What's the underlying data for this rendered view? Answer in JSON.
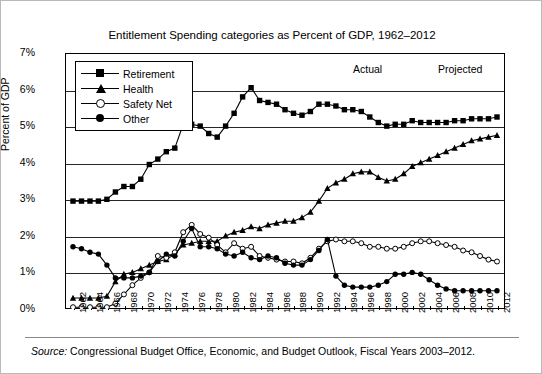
{
  "title": "Entitlement Spending categories as Percent of GDP, 1962–2012",
  "source_prefix": "Source:",
  "source_text": " Congressional Budget Office, Economic, and Budget Outlook, Fiscal Years 2003–2012.",
  "annotations": {
    "actual": "Actual",
    "projected": "Projected"
  },
  "legend": [
    {
      "label": "Retirement",
      "marker": "square-filled"
    },
    {
      "label": "Health",
      "marker": "triangle-filled"
    },
    {
      "label": "Safety Net",
      "marker": "circle-open"
    },
    {
      "label": "Other",
      "marker": "circle-filled"
    }
  ],
  "chart_data": {
    "type": "line",
    "title": "Entitlement Spending categories as Percent of GDP, 1962–2012",
    "xlabel": "",
    "ylabel": "Percent of GDP",
    "ylim": [
      0,
      7
    ],
    "ytick_labels": [
      "0%",
      "1%",
      "2%",
      "3%",
      "4%",
      "5%",
      "6%",
      "7%"
    ],
    "ytick_values": [
      0,
      1,
      2,
      3,
      4,
      5,
      6,
      7
    ],
    "grid": true,
    "legend_position": "top-left",
    "x": [
      1962,
      1963,
      1964,
      1965,
      1966,
      1967,
      1968,
      1969,
      1970,
      1971,
      1972,
      1973,
      1974,
      1975,
      1976,
      1977,
      1978,
      1979,
      1980,
      1981,
      1982,
      1983,
      1984,
      1985,
      1986,
      1987,
      1988,
      1989,
      1990,
      1991,
      1992,
      1993,
      1994,
      1995,
      1996,
      1997,
      1998,
      1999,
      2000,
      2001,
      2002,
      2003,
      2004,
      2005,
      2006,
      2007,
      2008,
      2009,
      2010,
      2011,
      2012
    ],
    "xtick_labels": [
      "1962",
      "1964",
      "1966",
      "1968",
      "1970",
      "1972",
      "1974",
      "1976",
      "1978",
      "1980",
      "1982",
      "1984",
      "1986",
      "1988",
      "1990",
      "1992",
      "1994",
      "1996",
      "1998",
      "2000",
      "2002",
      "2004",
      "2006",
      "2008",
      "2010",
      "2012"
    ],
    "series": [
      {
        "name": "Retirement",
        "marker": "square-filled",
        "values": [
          2.95,
          2.95,
          2.95,
          2.95,
          3.0,
          3.2,
          3.35,
          3.35,
          3.55,
          3.95,
          4.1,
          4.3,
          4.4,
          5.05,
          5.05,
          5.0,
          4.8,
          4.7,
          5.0,
          5.35,
          5.8,
          6.05,
          5.7,
          5.65,
          5.6,
          5.45,
          5.35,
          5.3,
          5.4,
          5.6,
          5.6,
          5.55,
          5.45,
          5.45,
          5.4,
          5.25,
          5.1,
          5.0,
          5.05,
          5.05,
          5.15,
          5.1,
          5.1,
          5.1,
          5.1,
          5.15,
          5.15,
          5.2,
          5.2,
          5.2,
          5.25
        ]
      },
      {
        "name": "Health",
        "marker": "triangle-filled",
        "values": [
          0.3,
          0.3,
          0.3,
          0.3,
          0.35,
          0.75,
          0.95,
          1.0,
          1.1,
          1.2,
          1.3,
          1.35,
          1.5,
          1.75,
          1.8,
          1.85,
          1.85,
          1.85,
          2.0,
          2.1,
          2.15,
          2.25,
          2.2,
          2.3,
          2.35,
          2.4,
          2.4,
          2.5,
          2.65,
          2.95,
          3.3,
          3.45,
          3.55,
          3.7,
          3.75,
          3.75,
          3.6,
          3.5,
          3.55,
          3.7,
          3.9,
          4.0,
          4.1,
          4.2,
          4.3,
          4.4,
          4.5,
          4.6,
          4.65,
          4.7,
          4.75
        ]
      },
      {
        "name": "Safety Net",
        "marker": "circle-open",
        "values": [
          0.05,
          0.05,
          0.05,
          0.05,
          0.05,
          0.15,
          0.4,
          0.65,
          0.85,
          1.0,
          1.45,
          1.4,
          1.55,
          2.1,
          2.3,
          2.05,
          1.95,
          1.75,
          1.55,
          1.8,
          1.65,
          1.7,
          1.45,
          1.4,
          1.35,
          1.3,
          1.3,
          1.25,
          1.4,
          1.65,
          1.85,
          1.9,
          1.85,
          1.85,
          1.8,
          1.7,
          1.7,
          1.65,
          1.65,
          1.7,
          1.8,
          1.85,
          1.85,
          1.8,
          1.75,
          1.7,
          1.6,
          1.55,
          1.45,
          1.35,
          1.3
        ]
      },
      {
        "name": "Other",
        "marker": "circle-filled",
        "values": [
          1.7,
          1.65,
          1.55,
          1.5,
          1.2,
          0.85,
          0.85,
          0.85,
          0.9,
          1.0,
          1.3,
          1.5,
          1.45,
          1.85,
          2.2,
          1.7,
          1.7,
          1.65,
          1.5,
          1.45,
          1.55,
          1.4,
          1.35,
          1.45,
          1.4,
          1.25,
          1.2,
          1.2,
          1.35,
          1.6,
          1.9,
          0.9,
          0.65,
          0.6,
          0.6,
          0.6,
          0.65,
          0.75,
          0.95,
          0.95,
          1.0,
          0.95,
          0.8,
          0.65,
          0.55,
          0.5,
          0.5,
          0.5,
          0.5,
          0.5,
          0.5
        ]
      }
    ]
  }
}
